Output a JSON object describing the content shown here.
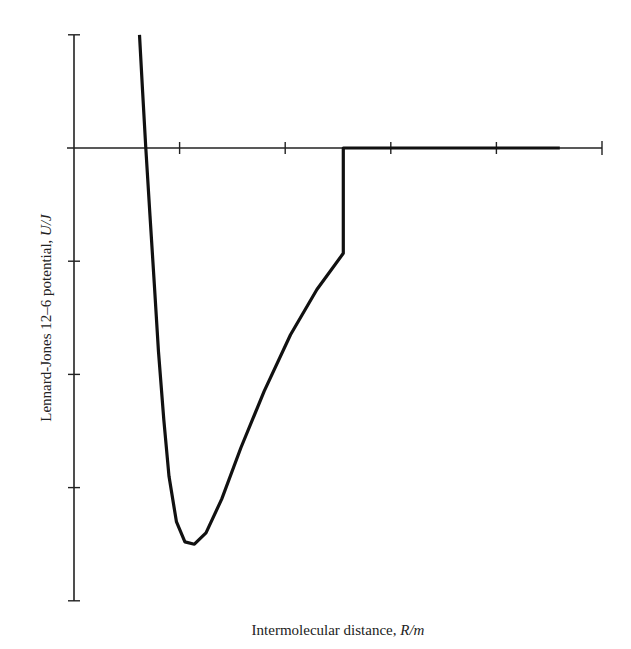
{
  "chart_data": {
    "type": "line",
    "title": "",
    "xlabel": "Intermolecular distance, R/m",
    "xlabel_parts": {
      "text": "Intermolecular distance, ",
      "unit": "R/m"
    },
    "ylabel": "Lennard-Jones 12–6 potential, U/J",
    "ylabel_parts": {
      "text": "Lennard-Jones 12–6 potential, ",
      "unit": "U/J"
    },
    "x_ticks_count": 5,
    "y_ticks_count": 5,
    "tick_labels": "none",
    "grid": false,
    "legend": null,
    "axis_units": "tick units (x: 0 at y-axis, 1 per tick; y: 0 at x-axis, 1 per tick upward)",
    "xlim": [
      0,
      5
    ],
    "ylim": [
      -4,
      1
    ],
    "series": [
      {
        "name": "Truncated Lennard-Jones potential",
        "x": [
          0.62,
          0.65,
          0.68,
          0.72,
          0.76,
          0.8,
          0.85,
          0.9,
          0.97,
          1.05,
          1.14,
          1.25,
          1.4,
          1.58,
          1.8,
          2.05,
          2.3,
          2.55,
          2.55,
          3.0,
          3.5,
          4.0,
          4.6
        ],
        "y": [
          1.0,
          0.5,
          0.0,
          -0.6,
          -1.2,
          -1.8,
          -2.4,
          -2.9,
          -3.3,
          -3.48,
          -3.5,
          -3.4,
          -3.1,
          -2.65,
          -2.15,
          -1.65,
          -1.25,
          -0.93,
          0.0,
          0.0,
          0.0,
          0.0,
          0.0
        ]
      }
    ],
    "annotations": [
      "potential truncated to zero at cutoff distance ≈ 2.55 tick units"
    ]
  }
}
